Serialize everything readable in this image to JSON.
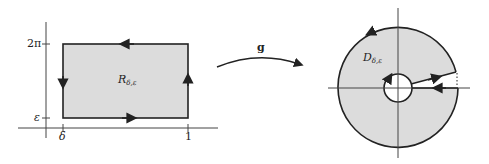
{
  "figure": {
    "left_panel": {
      "region_label": "R",
      "region_subscript": "δ,ε",
      "y_ticks": [
        "2π",
        "ε"
      ],
      "x_ticks": [
        "δ",
        "1"
      ],
      "rectangle": {
        "x_range": [
          "δ",
          "1"
        ],
        "y_range": [
          "ε",
          "2π"
        ],
        "fill": "#dcdcdc",
        "orientation": "clockwise arrows: right on bottom, up on right, left on top, down on left"
      }
    },
    "map": {
      "label": "g",
      "type": "curved arrow"
    },
    "right_panel": {
      "region_label": "D",
      "region_subscript": "δ,ε",
      "shape": "annulus with slit along positive real axis",
      "fill": "#dcdcdc"
    },
    "colors": {
      "stroke": "#222222",
      "fill": "#dcdcdc",
      "background": "#ffffff"
    }
  }
}
